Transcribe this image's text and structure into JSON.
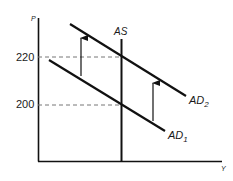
{
  "diagram": {
    "type": "aggregate-demand-aggregate-supply",
    "axes": {
      "y_label": "P",
      "x_label": "Y"
    },
    "price_levels": [
      {
        "label": "220",
        "value": 220
      },
      {
        "label": "200",
        "value": 200
      }
    ],
    "curves": [
      {
        "id": "AS",
        "label": "AS",
        "sub": "",
        "kind": "vertical supply"
      },
      {
        "id": "AD1",
        "label": "AD",
        "sub": "1",
        "kind": "downward-sloping demand"
      },
      {
        "id": "AD2",
        "label": "AD",
        "sub": "2",
        "kind": "downward-sloping demand (shifted up)"
      }
    ],
    "arrows": [
      {
        "id": "shift-arrow-left",
        "direction": "up",
        "from": "AD1",
        "to": "AD2"
      },
      {
        "id": "shift-arrow-right",
        "direction": "up",
        "from": "AD1",
        "to": "AD2"
      }
    ],
    "colors": {
      "line": "#111111",
      "dashed": "#777777",
      "background": "#ffffff"
    }
  }
}
